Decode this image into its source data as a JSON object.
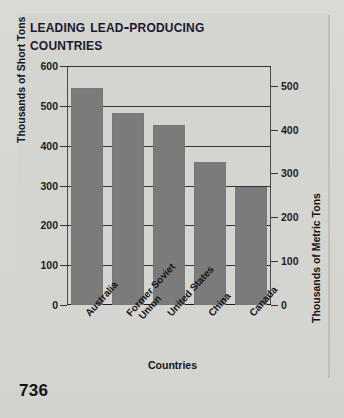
{
  "page": {
    "page_number": "736",
    "background_color": "#d4d4d1",
    "bar_color": "#7b7b7b",
    "text_color": "#1a1a2e"
  },
  "chart_data": {
    "type": "bar",
    "title_line1": "Leading Lead-Producing",
    "title_line2": "Countries",
    "title": "Leading Lead-Producing Countries",
    "xlabel": "Countries",
    "ylabel": "Thousands of Short Tons",
    "ylabel_secondary": "Thousands of Metric Tons",
    "categories": [
      "Australia",
      "Former Soviet Union",
      "United States",
      "China",
      "Canada"
    ],
    "category_lines": [
      [
        "Australia"
      ],
      [
        "Former Soviet",
        "Union"
      ],
      [
        "United States"
      ],
      [
        "China"
      ],
      [
        "Canada"
      ]
    ],
    "values": [
      545,
      483,
      452,
      360,
      297
    ],
    "ylim": [
      0,
      600
    ],
    "yticks": [
      0,
      100,
      200,
      300,
      400,
      500,
      600
    ],
    "ytick_labels": [
      "0",
      "100",
      "200",
      "300",
      "400",
      "500",
      "600"
    ],
    "ylim_secondary": [
      0,
      545
    ],
    "yticks_secondary": [
      0,
      100,
      200,
      300,
      400,
      500
    ],
    "ytick_labels_secondary": [
      "0",
      "100",
      "200",
      "300",
      "400",
      "500"
    ],
    "grid": true,
    "legend": "none",
    "unit_left": "thousands of short tons",
    "unit_right": "thousands of metric tons"
  }
}
